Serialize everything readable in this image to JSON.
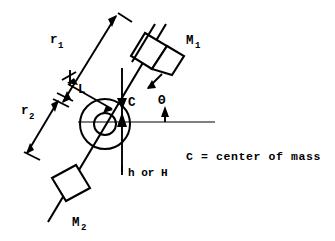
{
  "figure": {
    "type": "engineering-schematic",
    "background_color": "#ffffff",
    "line_color": "#000000"
  },
  "labels": {
    "r1": {
      "text": "r",
      "subscript": "1"
    },
    "r2": {
      "text": "r",
      "subscript": "2"
    },
    "L": {
      "text": "L"
    },
    "C": {
      "text": "C"
    },
    "theta": {
      "text": "Θ"
    },
    "M1": {
      "text": "M",
      "subscript": "1"
    },
    "M2": {
      "text": "M",
      "subscript": "2"
    },
    "height": {
      "text": "h or H"
    },
    "legend": {
      "text": "C = center of mass"
    }
  },
  "annotations": {
    "mass_1_name": "M1",
    "mass_2_name": "M2",
    "radius_1_name": "r1",
    "radius_2_name": "r2",
    "length_name": "L",
    "center_of_mass_name": "C",
    "angle_name": "Theta",
    "height_name": "h or H"
  }
}
